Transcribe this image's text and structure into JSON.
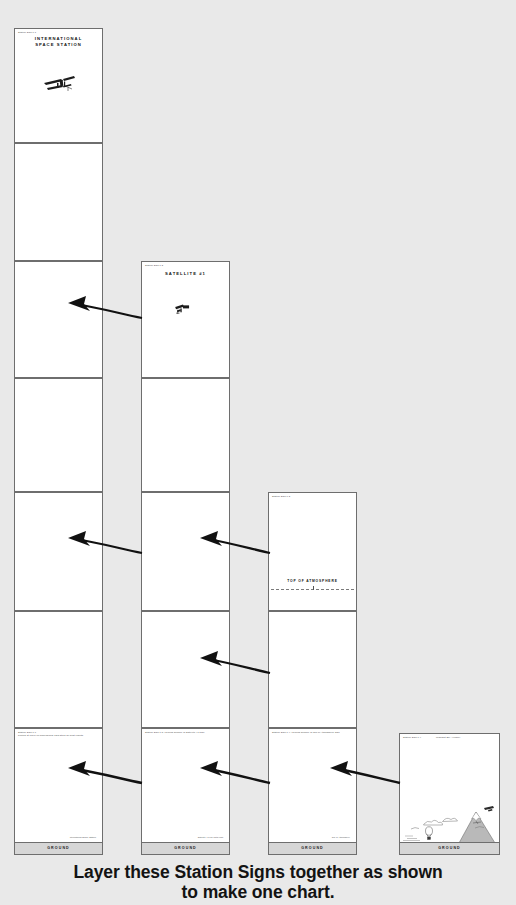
{
  "page": {
    "background_color": "#e9e9e9",
    "caption_line1": "Layer these Station Signs together as shown",
    "caption_line2": "to make one chart."
  },
  "columns": [
    {
      "name": "international-space-station",
      "title": "INTERNATIONAL\nSPACE STATION",
      "corner_label": "Station Sign 1.1",
      "cards": [
        {
          "corner": "Station Sign 1.1",
          "title": "INTERNATIONAL SPACE STATION",
          "illustration": "iss-icon"
        },
        {
          "corner": "",
          "title": "",
          "illustration": ""
        },
        {
          "corner": "",
          "title": "",
          "illustration": ""
        },
        {
          "corner": "",
          "title": "",
          "illustration": ""
        },
        {
          "corner": "",
          "title": "",
          "illustration": ""
        },
        {
          "corner": "Station Sign 1.6",
          "corner2": "Printed at 100% on dimensional card stock for best results.",
          "title": "",
          "illustration": "ground",
          "ground_label": "GROUND",
          "sidenote": "International\nSpace Station"
        }
      ]
    },
    {
      "name": "satellite-1",
      "title": "SATELLITE #1",
      "corner_label": "Station Sign 1.2",
      "cards": [
        {
          "corner": "Station Sign 1.2",
          "title": "SATELLITE #1",
          "illustration": "satellite-icon"
        },
        {
          "corner": "",
          "title": "",
          "illustration": ""
        },
        {
          "corner": "",
          "title": "",
          "illustration": ""
        },
        {
          "corner": "Station Sign 1.5 | ground surface of Satellite #1 sign",
          "title": "",
          "illustration": "ground",
          "ground_label": "GROUND",
          "sidenote": "Satellite #1\nlow earth orbit"
        }
      ]
    },
    {
      "name": "top-of-atmosphere",
      "title": "TOP OF ATMOSPHERE",
      "corner_label": "Station Sign 1.3",
      "cards": [
        {
          "corner": "Station Sign 1.3",
          "title": "",
          "marker": "TOP OF ATMOSPHERE"
        },
        {
          "corner": "",
          "title": "",
          "illustration": ""
        },
        {
          "corner": "Station Sign 1.4 | ground surface of Top of Atmosphere sign",
          "title": "",
          "illustration": "ground",
          "ground_label": "GROUND",
          "sidenote": "Top of\nAtmosphere"
        }
      ]
    },
    {
      "name": "midnight-sky-allegory",
      "title": "Midnight Sky Allegory",
      "corner_label": "Station Sign 1.4",
      "cards": [
        {
          "corner": "Station Sign 1.4",
          "title": "Midnight Sky Allegory",
          "illustration": "mountain-scene",
          "ground_label": "GROUND"
        }
      ]
    }
  ],
  "arrows": [
    {
      "name": "arrow-row2-col2-to-col1",
      "row": 2
    },
    {
      "name": "arrow-row4-col2-to-col1",
      "row": 4
    },
    {
      "name": "arrow-row4-col3-to-col2",
      "row": 4
    },
    {
      "name": "arrow-row5-col3-to-col2",
      "row": 5
    },
    {
      "name": "arrow-row6-col2-to-col1",
      "row": 6
    },
    {
      "name": "arrow-row6-col3-to-col2",
      "row": 6
    },
    {
      "name": "arrow-row6-col4-to-col3",
      "row": 6
    }
  ],
  "labels": {
    "ground": "GROUND",
    "top_of_atmosphere": "TOP OF ATMOSPHERE",
    "iss_title_l1": "INTERNATIONAL",
    "iss_title_l2": "SPACE STATION",
    "satellite_title": "SATELLITE #1",
    "midnight_title": "Midnight Sky Allegory",
    "corner_11": "Station Sign 1.1",
    "corner_12": "Station Sign 1.2",
    "corner_13": "Station Sign 1.3",
    "corner_14": "Station Sign 1.4",
    "corner_16": "Station Sign 1.6",
    "note_col1": "Printed at 100% on dimensional card stock for best results.",
    "note_col2": "Station Sign 1.5 | ground surface of Satellite #1 sign",
    "note_col3": "Station Sign 1.4 | ground surface of Top of Atmosphere sign",
    "side_col1": "International Space Station",
    "side_col2": "Satellite #1 low earth orbit",
    "side_col3": "Top of Atmosphere"
  }
}
